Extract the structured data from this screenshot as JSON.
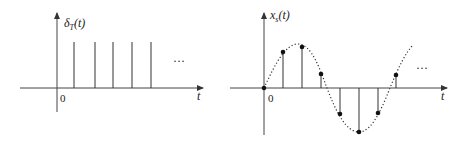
{
  "left_plot": {
    "y_label_main": "δ",
    "y_label_sub": "T",
    "y_label_arg": "(t)",
    "x_label": "t",
    "origin_label": "0",
    "ellipsis": "···",
    "impulse_count": 5,
    "impulse_positions_t": [
      1,
      2,
      3,
      4,
      5
    ],
    "impulse_height": 1
  },
  "right_plot": {
    "y_label_main": "x",
    "y_label_sub": "s",
    "y_label_arg": "(t)",
    "x_label": "t",
    "origin_label": "0",
    "ellipsis": "···",
    "continuous_signal": "sinusoid (dotted envelope)",
    "samples": [
      {
        "n": 0,
        "value": 0.0
      },
      {
        "n": 1,
        "value": 0.82
      },
      {
        "n": 2,
        "value": 0.93
      },
      {
        "n": 3,
        "value": 0.32
      },
      {
        "n": 4,
        "value": -0.59
      },
      {
        "n": 5,
        "value": -1.0
      },
      {
        "n": 6,
        "value": -0.57
      },
      {
        "n": 7,
        "value": 0.3
      }
    ]
  },
  "colors": {
    "line": "#333333",
    "background": "#ffffff"
  }
}
